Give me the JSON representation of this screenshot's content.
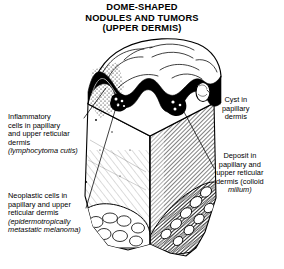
{
  "title": {
    "line1": "DOME-SHAPED",
    "line2": "NODULES AND TUMORS",
    "line3": "(UPPER DERMIS)"
  },
  "labels": {
    "inflammatory": {
      "line1": "Inflammatory",
      "line2": "cells in papillary",
      "line3": "and upper reticular",
      "line4": "dermis",
      "line5": "(lymphocytoma cutis)"
    },
    "neoplastic": {
      "line1": "Neoplastic cells in",
      "line2": "papillary and upper",
      "line3": "reticular dermis",
      "line4": "(epidermotropically",
      "line5": "metastatic melanoma)"
    },
    "cyst": {
      "line1": "Cyst in",
      "line2": "papillary",
      "line3": "dermis"
    },
    "deposit": {
      "line1": "Deposit in",
      "line2": "papillary and",
      "line3": "upper reticular",
      "line4": "dermis (colloid",
      "line5": "milium)"
    }
  },
  "figure": {
    "ink_color": "#000000",
    "background_color": "#ffffff",
    "parts": [
      "epidermis-band",
      "dome-nodule-surface",
      "papillary-dermis",
      "reticular-dermis",
      "subcutaneous-fat",
      "cyst-inclusion",
      "inflammatory-infiltrate",
      "neoplastic-cell-cluster",
      "colloid-deposit"
    ]
  }
}
